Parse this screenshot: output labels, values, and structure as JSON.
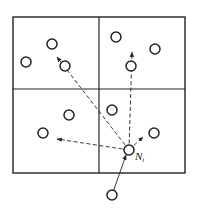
{
  "diagram": {
    "colors": {
      "stroke": "#222222",
      "background": "#ffffff"
    },
    "grid": {
      "x0": 13,
      "y0": 17,
      "x1": 185,
      "y1": 173,
      "midx": 99,
      "midy": 89
    },
    "nodes": [
      {
        "id": "n1",
        "x": 52,
        "y": 44
      },
      {
        "id": "n2",
        "x": 26,
        "y": 62
      },
      {
        "id": "n3",
        "x": 65,
        "y": 66
      },
      {
        "id": "n4",
        "x": 116,
        "y": 37
      },
      {
        "id": "n5",
        "x": 155,
        "y": 49
      },
      {
        "id": "n6",
        "x": 131,
        "y": 66
      },
      {
        "id": "n7",
        "x": 69,
        "y": 115
      },
      {
        "id": "n8",
        "x": 43,
        "y": 133
      },
      {
        "id": "n9",
        "x": 112,
        "y": 110
      },
      {
        "id": "n10",
        "x": 154,
        "y": 133
      },
      {
        "id": "ni",
        "x": 129,
        "y": 150
      },
      {
        "id": "n12",
        "x": 112,
        "y": 195
      }
    ],
    "node_label": {
      "main": "N",
      "sub": "i",
      "x": 135,
      "y": 160
    },
    "arrows": [
      {
        "from": [
          129,
          150
        ],
        "to": [
          57,
          57
        ],
        "style": "dashed"
      },
      {
        "from": [
          129,
          150
        ],
        "to": [
          132,
          52
        ],
        "style": "dashed"
      },
      {
        "from": [
          129,
          150
        ],
        "to": [
          57,
          139
        ],
        "style": "dashed"
      },
      {
        "from": [
          129,
          150
        ],
        "to": [
          143,
          137
        ],
        "style": "dashed"
      },
      {
        "from": [
          112,
          195
        ],
        "to": [
          126,
          155
        ],
        "style": "solid"
      }
    ]
  }
}
